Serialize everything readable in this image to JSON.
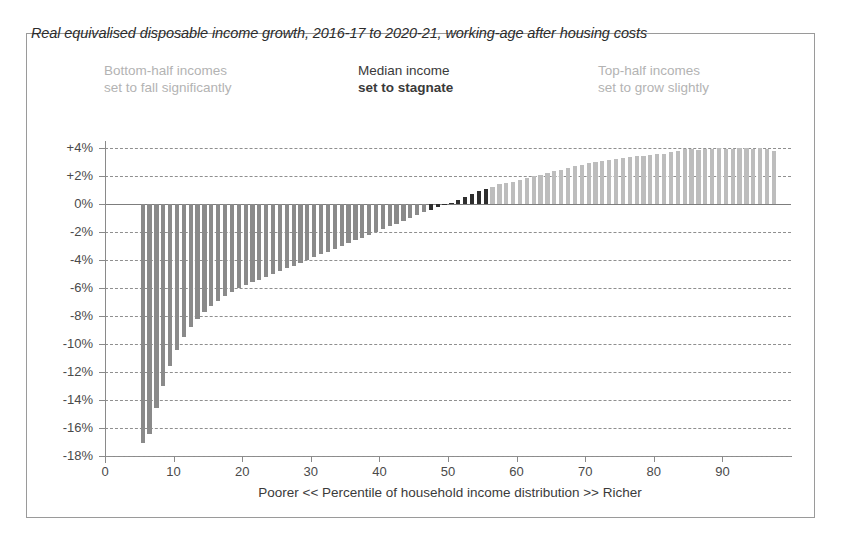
{
  "chart_data": {
    "type": "bar",
    "title": "Real equivalised disposable income growth, 2016-17 to 2020-21, working-age after housing costs",
    "xlabel": "Poorer  <<   Percentile of household income distribution  >>  Richer",
    "ylabel": "",
    "ylim": [
      -18,
      4
    ],
    "xlim": [
      0,
      100
    ],
    "grid": true,
    "legend": "none",
    "ytick_labels": [
      "+4%",
      "+2%",
      "0%",
      "-2%",
      "-4%",
      "-6%",
      "-8%",
      "-10%",
      "-12%",
      "-14%",
      "-16%",
      "-18%"
    ],
    "ytick_values": [
      4,
      2,
      0,
      -2,
      -4,
      -6,
      -8,
      -10,
      -12,
      -14,
      -16,
      -18
    ],
    "xtick_labels": [
      "0",
      "10",
      "20",
      "30",
      "40",
      "50",
      "60",
      "70",
      "80",
      "90"
    ],
    "xtick_values": [
      0,
      10,
      20,
      30,
      40,
      50,
      60,
      70,
      80,
      90
    ],
    "categories": [
      5,
      6,
      7,
      8,
      9,
      10,
      11,
      12,
      13,
      14,
      15,
      16,
      17,
      18,
      19,
      20,
      21,
      22,
      23,
      24,
      25,
      26,
      27,
      28,
      29,
      30,
      31,
      32,
      33,
      34,
      35,
      36,
      37,
      38,
      39,
      40,
      41,
      42,
      43,
      44,
      45,
      46,
      47,
      48,
      49,
      50,
      51,
      52,
      53,
      54,
      55,
      56,
      57,
      58,
      59,
      60,
      61,
      62,
      63,
      64,
      65,
      66,
      67,
      68,
      69,
      70,
      71,
      72,
      73,
      74,
      75,
      76,
      77,
      78,
      79,
      80,
      81,
      82,
      83,
      84,
      85,
      86,
      87,
      88,
      89,
      90,
      91,
      92,
      93,
      94,
      95,
      96,
      97
    ],
    "values": [
      -17.1,
      -16.4,
      -14.6,
      -13.0,
      -11.6,
      -10.4,
      -9.5,
      -8.8,
      -8.2,
      -7.7,
      -7.3,
      -6.9,
      -6.6,
      -6.3,
      -6.0,
      -5.8,
      -5.6,
      -5.4,
      -5.2,
      -5.0,
      -4.8,
      -4.6,
      -4.4,
      -4.2,
      -4.0,
      -3.8,
      -3.6,
      -3.4,
      -3.2,
      -3.0,
      -2.8,
      -2.6,
      -2.4,
      -2.2,
      -2.0,
      -1.8,
      -1.6,
      -1.4,
      -1.2,
      -1.0,
      -0.8,
      -0.6,
      -0.4,
      -0.2,
      -0.1,
      0.1,
      0.3,
      0.5,
      0.7,
      0.9,
      1.1,
      1.25,
      1.4,
      1.5,
      1.6,
      1.7,
      1.85,
      2.0,
      2.1,
      2.2,
      2.35,
      2.45,
      2.6,
      2.7,
      2.8,
      2.9,
      3.0,
      3.05,
      3.15,
      3.2,
      3.3,
      3.35,
      3.4,
      3.45,
      3.5,
      3.55,
      3.6,
      3.7,
      3.8,
      3.9,
      3.95,
      3.85,
      3.9,
      3.95,
      4.0,
      3.9,
      3.95,
      4.0,
      4.0,
      3.95,
      4.0,
      3.95,
      3.8
    ],
    "series_colors": {
      "bottom_half": "#8a8a8a",
      "median": "#2e2e2e",
      "top_half": "#bdbdbd"
    },
    "median_band": [
      47,
      55
    ],
    "top_half_start": 56
  },
  "annotations": {
    "left": {
      "line1": "Bottom-half incomes",
      "line2": "set to fall significantly"
    },
    "middle": {
      "line1": "Median income",
      "line2": "set to stagnate"
    },
    "right": {
      "line1": "Top-half incomes",
      "line2": "set to grow slightly"
    }
  }
}
